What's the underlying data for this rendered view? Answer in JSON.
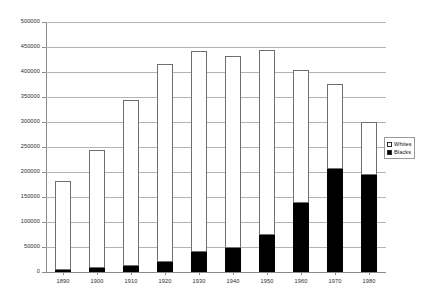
{
  "chart_data": {
    "type": "bar",
    "subtype": "stacked-bar",
    "title": "",
    "subtitle": "",
    "xlabel": "",
    "ylabel": "",
    "categories": [
      "1890",
      "1900",
      "1910",
      "1920",
      "1930",
      "1940",
      "1950",
      "1960",
      "1970",
      "1980"
    ],
    "series": [
      {
        "name": "Blacks",
        "color": "#000000",
        "values": [
          4000,
          9000,
          13000,
          20000,
          41000,
          48000,
          74000,
          138000,
          207000,
          194000
        ]
      },
      {
        "name": "Whites",
        "color": "#ffffff",
        "values": [
          178000,
          236000,
          332000,
          396000,
          402000,
          384000,
          370000,
          267000,
          170000,
          107000
        ]
      }
    ],
    "totals": [
      182000,
      245000,
      345000,
      416000,
      443000,
      432000,
      444000,
      405000,
      377000,
      301000
    ],
    "ylim": [
      0,
      500000
    ],
    "ytick_step": 50000,
    "ytick_labels": [
      "0",
      "50000",
      "100000",
      "150000",
      "200000",
      "250000",
      "300000",
      "350000",
      "400000",
      "450000",
      "500000"
    ],
    "ytick_values": [
      0,
      50000,
      100000,
      150000,
      200000,
      250000,
      300000,
      350000,
      400000,
      450000,
      500000
    ],
    "grid": true,
    "grid_axis": "y",
    "legend": {
      "position": "right",
      "entries": [
        {
          "label": "Whites",
          "swatch": "white"
        },
        {
          "label": "Blacks",
          "swatch": "black"
        }
      ]
    }
  }
}
